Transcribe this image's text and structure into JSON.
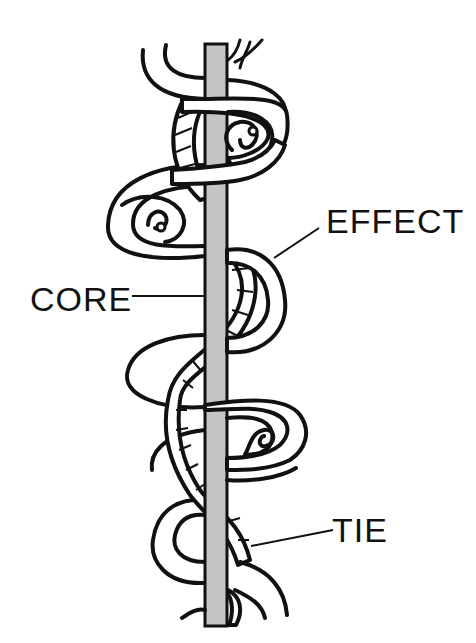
{
  "diagram": {
    "type": "yarn-structure-illustration",
    "labels": {
      "effect": "EFFECT",
      "core": "CORE",
      "tie": "TIE"
    },
    "colors": {
      "core_fill": "#c4c4c4",
      "ink": "#111111",
      "background": "#ffffff"
    },
    "components": [
      {
        "name": "core",
        "description": "straight vertical gray central strand"
      },
      {
        "name": "effect",
        "description": "looped, curled white strand wrapping around the core"
      },
      {
        "name": "tie",
        "description": "hatched twisted binder strand spiraling around core and effect"
      }
    ]
  }
}
